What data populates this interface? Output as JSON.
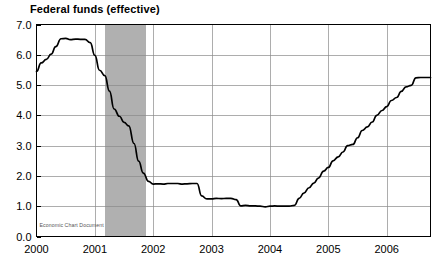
{
  "chart_data": {
    "type": "line",
    "title": "Federal funds (effective)",
    "xlabel": "",
    "ylabel": "",
    "xlim": [
      2000.0,
      2006.75
    ],
    "ylim": [
      0.0,
      7.0
    ],
    "grid": true,
    "legend": null,
    "yticks": [
      "0.0",
      "1.0",
      "2.0",
      "3.0",
      "4.0",
      "5.0",
      "6.0",
      "7.0"
    ],
    "ytick_values": [
      0.0,
      1.0,
      2.0,
      3.0,
      4.0,
      5.0,
      6.0,
      7.0
    ],
    "xticks": [
      "2000",
      "2001",
      "2002",
      "2003",
      "2004",
      "2005",
      "2006"
    ],
    "xtick_values": [
      2000,
      2001,
      2002,
      2003,
      2004,
      2005,
      2006
    ],
    "watermark": "Economic Chart Document",
    "shaded_regions": [
      {
        "label": "recession",
        "x_start": 2001.17,
        "x_end": 2001.87,
        "color": "#b0b0b0"
      }
    ],
    "series": [
      {
        "name": "Federal funds (effective)",
        "color": "#000000",
        "x": [
          2000.0,
          2000.08,
          2000.17,
          2000.25,
          2000.33,
          2000.42,
          2000.5,
          2000.58,
          2000.67,
          2000.75,
          2000.83,
          2000.92,
          2001.0,
          2001.08,
          2001.17,
          2001.25,
          2001.33,
          2001.42,
          2001.5,
          2001.58,
          2001.67,
          2001.75,
          2001.83,
          2001.92,
          2002.0,
          2002.08,
          2002.17,
          2002.25,
          2002.33,
          2002.42,
          2002.5,
          2002.58,
          2002.67,
          2002.75,
          2002.83,
          2002.92,
          2003.0,
          2003.08,
          2003.17,
          2003.25,
          2003.33,
          2003.42,
          2003.5,
          2003.58,
          2003.67,
          2003.75,
          2003.83,
          2003.92,
          2004.0,
          2004.08,
          2004.17,
          2004.25,
          2004.33,
          2004.42,
          2004.5,
          2004.58,
          2004.67,
          2004.75,
          2004.83,
          2004.92,
          2005.0,
          2005.08,
          2005.17,
          2005.25,
          2005.33,
          2005.42,
          2005.5,
          2005.58,
          2005.67,
          2005.75,
          2005.83,
          2005.92,
          2006.0,
          2006.08,
          2006.17,
          2006.25,
          2006.33,
          2006.42,
          2006.5,
          2006.58,
          2006.67,
          2006.75
        ],
        "y": [
          5.45,
          5.73,
          5.85,
          6.02,
          6.27,
          6.53,
          6.54,
          6.5,
          6.52,
          6.51,
          6.51,
          6.4,
          5.98,
          5.49,
          5.31,
          4.8,
          4.21,
          3.97,
          3.77,
          3.65,
          3.07,
          2.49,
          2.09,
          1.82,
          1.73,
          1.74,
          1.73,
          1.75,
          1.75,
          1.75,
          1.73,
          1.74,
          1.75,
          1.75,
          1.34,
          1.24,
          1.24,
          1.26,
          1.25,
          1.26,
          1.26,
          1.22,
          1.01,
          1.03,
          1.01,
          1.01,
          1.0,
          0.98,
          1.0,
          1.01,
          1.0,
          1.0,
          1.0,
          1.03,
          1.26,
          1.43,
          1.61,
          1.76,
          1.93,
          2.16,
          2.28,
          2.5,
          2.63,
          2.79,
          3.0,
          3.04,
          3.26,
          3.5,
          3.62,
          3.78,
          4.0,
          4.16,
          4.29,
          4.49,
          4.59,
          4.79,
          4.94,
          4.99,
          5.24,
          5.25,
          5.25,
          5.25
        ]
      }
    ]
  }
}
